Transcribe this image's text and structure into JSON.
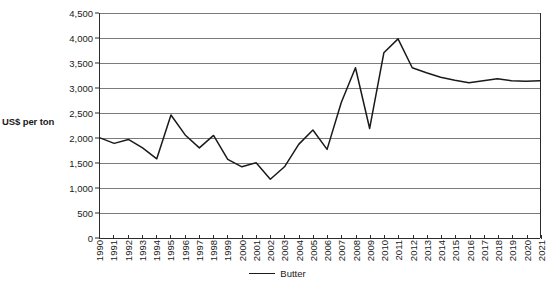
{
  "chart_data": {
    "type": "line",
    "title": "",
    "subtitle": "",
    "xlabel": "",
    "ylabel": "US$ per ton",
    "ylim": [
      0,
      4500
    ],
    "ytick_step": 500,
    "ytick_labels": [
      "0",
      "500",
      "1,000",
      "1,500",
      "2,000",
      "2,500",
      "3,000",
      "3,500",
      "4,000",
      "4,500"
    ],
    "ytick_values": [
      0,
      500,
      1000,
      1500,
      2000,
      2500,
      3000,
      3500,
      4000,
      4500
    ],
    "grid": true,
    "grid_axis": "y",
    "legend_position": "bottom-center",
    "line_color": "#1a1a1a",
    "gridline_color": "#7b7b7b",
    "axis_color": "#2b2b2b",
    "categories": [
      "1990",
      "1991",
      "1992",
      "1993",
      "1994",
      "1995",
      "1996",
      "1997",
      "1998",
      "1999",
      "2000",
      "2001",
      "2002",
      "2003",
      "2004",
      "2005",
      "2006",
      "2007",
      "2008",
      "2009",
      "2010",
      "2011",
      "2012",
      "2013",
      "2014",
      "2015",
      "2016",
      "2017",
      "2018",
      "2019",
      "2020",
      "2021"
    ],
    "series": [
      {
        "name": "Butter",
        "values": [
          1990,
          1880,
          1960,
          1790,
          1570,
          2450,
          2050,
          1790,
          2040,
          1560,
          1410,
          1490,
          1160,
          1410,
          1860,
          2150,
          1760,
          2700,
          3400,
          2180,
          3700,
          3980,
          3400,
          3300,
          3210,
          3150,
          3100,
          3140,
          3180,
          3140,
          3130,
          3140
        ]
      }
    ],
    "legend_entries": [
      {
        "label": "Butter",
        "marker": "line",
        "color": "#1a1a1a"
      }
    ]
  }
}
